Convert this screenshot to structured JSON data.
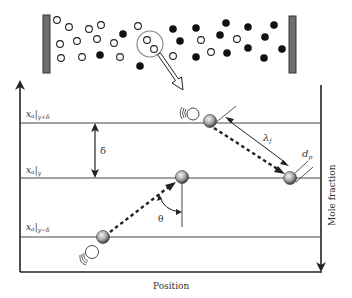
{
  "diagram": {
    "colors": {
      "wall": "#6e6e6e",
      "line": "#333333",
      "particle_dark": "#111111",
      "particle_light": "#ffffff",
      "sphere_highlight": "#eeeeee",
      "sphere_shadow": "#555555"
    },
    "labels": {
      "level_top_main": "x",
      "level_top_sub_a": "a",
      "level_top_sub": "y+δ",
      "level_mid_main": "x",
      "level_mid_sub_a": "a",
      "level_mid_sub": "y",
      "level_bot_main": "x",
      "level_bot_sub_a": "a",
      "level_bot_sub": "y−δ",
      "delta": "δ",
      "lambda_main": "λ",
      "lambda_sub": "f",
      "dp_main": "d",
      "dp_sub": "p",
      "theta": "θ",
      "x_axis": "Position",
      "y_axis": "Mole fraction"
    },
    "chamber": {
      "open_circles": [
        [
          57,
          20
        ],
        [
          69,
          27
        ],
        [
          89,
          29
        ],
        [
          101,
          25
        ],
        [
          60,
          44
        ],
        [
          77,
          41
        ],
        [
          97,
          39
        ],
        [
          114,
          43
        ],
        [
          61,
          58
        ],
        [
          82,
          57
        ],
        [
          120,
          57
        ],
        [
          138,
          26
        ],
        [
          147,
          40
        ],
        [
          154,
          49
        ],
        [
          201,
          40
        ],
        [
          237,
          39
        ],
        [
          173,
          56
        ],
        [
          211,
          52
        ]
      ],
      "filled_circles": [
        [
          123,
          34
        ],
        [
          100,
          55
        ],
        [
          140,
          66
        ],
        [
          173,
          29
        ],
        [
          180,
          41
        ],
        [
          196,
          28
        ],
        [
          226,
          23
        ],
        [
          220,
          35
        ],
        [
          248,
          27
        ],
        [
          274,
          25
        ],
        [
          265,
          37
        ],
        [
          248,
          48
        ],
        [
          227,
          53
        ],
        [
          196,
          57
        ],
        [
          264,
          58
        ],
        [
          282,
          49
        ]
      ]
    },
    "particles": [
      {
        "name": "particle-top",
        "x": 210,
        "y": 121
      },
      {
        "name": "particle-mid-right",
        "x": 290,
        "y": 178
      },
      {
        "name": "particle-mid-left",
        "x": 182,
        "y": 177
      },
      {
        "name": "particle-bottom",
        "x": 103,
        "y": 237
      }
    ]
  }
}
